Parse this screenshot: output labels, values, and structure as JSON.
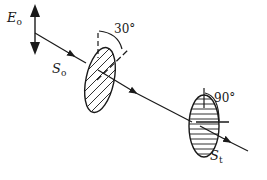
{
  "diagram": {
    "labels": {
      "E": "E",
      "E_sub": "o",
      "S0": "S",
      "S0_sub": "o",
      "St": "S",
      "St_sub": "t",
      "angle1": "30°",
      "angle2": "90°"
    },
    "colors": {
      "stroke": "#1a1a1a",
      "background": "#ffffff"
    }
  }
}
